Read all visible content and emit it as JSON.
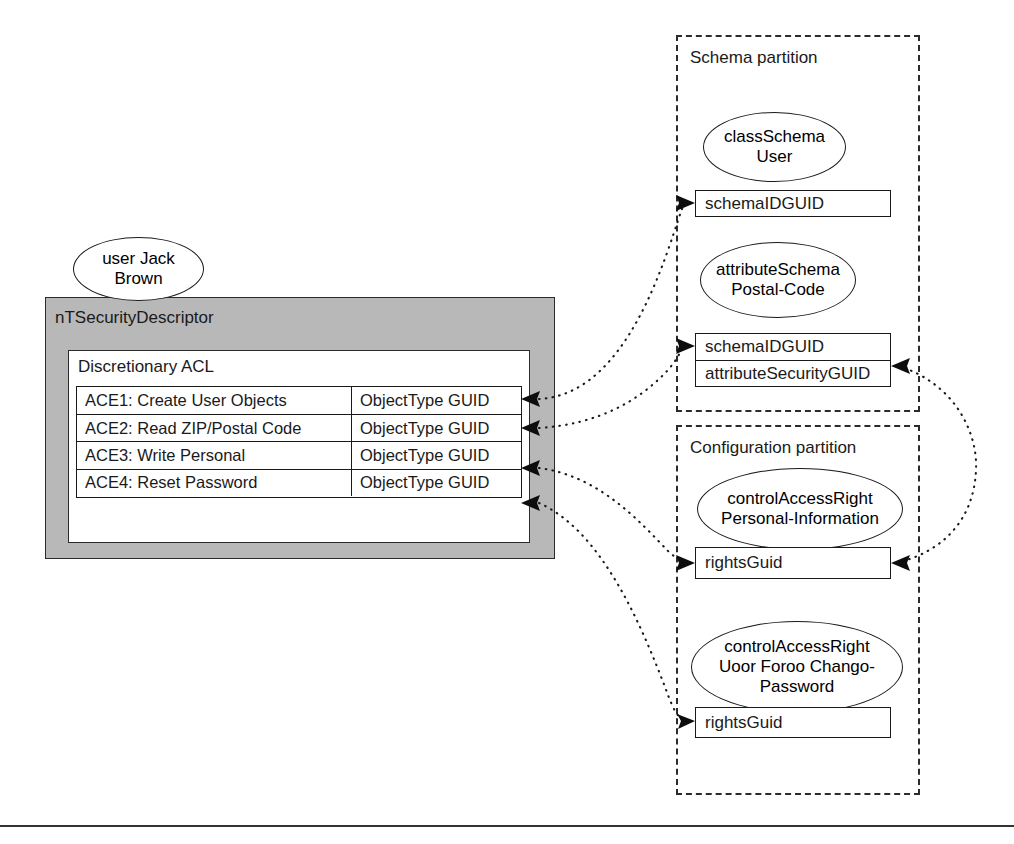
{
  "diagram": {
    "bottom_rule": true
  },
  "user_node": {
    "line1": "user Jack",
    "line2": "Brown"
  },
  "security_descriptor": {
    "title": "nTSecurityDescriptor",
    "dacl_title": "Discretionary ACL",
    "ace_rows": [
      {
        "name": "ACE1: Create User Objects",
        "guid": "ObjectType GUID"
      },
      {
        "name": "ACE2: Read ZIP/Postal Code",
        "guid": "ObjectType GUID"
      },
      {
        "name": "ACE3: Write Personal",
        "guid": "ObjectType GUID"
      },
      {
        "name": "ACE4: Reset Password",
        "guid": "ObjectType GUID"
      }
    ]
  },
  "schema_partition": {
    "title": "Schema partition",
    "class_schema": {
      "line1": "classSchema",
      "line2": "User",
      "attributes": [
        "schemaIDGUID"
      ]
    },
    "attribute_schema": {
      "line1": "attributeSchema",
      "line2": "Postal-Code",
      "attributes": [
        "schemaIDGUID",
        "attributeSecurityGUID"
      ]
    }
  },
  "configuration_partition": {
    "title": "Configuration partition",
    "personal_information": {
      "line1": "controlAccessRight",
      "line2": "Personal-Information",
      "attributes": [
        "rightsGuid"
      ]
    },
    "force_change_password": {
      "line1": "controlAccessRight",
      "line2": "Uoor Foroo Chango-",
      "line3": "Password",
      "attributes": [
        "rightsGuid"
      ]
    }
  },
  "colors": {
    "descriptor_fill": "#b8b8b8",
    "stroke": "#1a1a1a",
    "partition_stroke": "#2b2b2b",
    "background": "#ffffff"
  }
}
